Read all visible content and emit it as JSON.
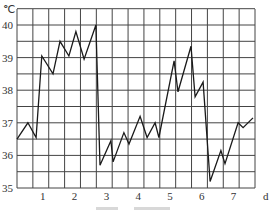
{
  "chart_data": {
    "type": "line",
    "title": "",
    "xlabel": "d",
    "ylabel": "℃",
    "xlim": [
      0,
      7.8
    ],
    "ylim": [
      35,
      40.5
    ],
    "grid": true,
    "x_ticks": [
      "1",
      "2",
      "3",
      "4",
      "5",
      "6",
      "7"
    ],
    "y_ticks": [
      "35",
      "36",
      "37",
      "38",
      "39",
      "40"
    ],
    "series": [
      {
        "name": "body temperature",
        "x": [
          0.19,
          0.53,
          0.79,
          0.97,
          1.32,
          1.54,
          1.82,
          2.04,
          2.3,
          2.67,
          2.8,
          3.14,
          3.21,
          3.55,
          3.71,
          4.06,
          4.28,
          4.53,
          4.65,
          5.13,
          5.25,
          5.66,
          5.79,
          6.04,
          6.26,
          6.6,
          6.73,
          7.14,
          7.3,
          7.61
        ],
        "values": [
          36.5,
          37.0,
          36.55,
          39.05,
          38.5,
          39.5,
          39.05,
          39.8,
          38.95,
          40.0,
          35.7,
          36.45,
          35.8,
          36.7,
          36.35,
          37.2,
          36.55,
          37.0,
          36.55,
          38.9,
          37.95,
          39.35,
          37.8,
          38.25,
          35.2,
          36.15,
          35.75,
          37.0,
          36.85,
          37.15
        ]
      }
    ]
  },
  "axis": {
    "y_unit": "℃",
    "x_unit": "d"
  }
}
